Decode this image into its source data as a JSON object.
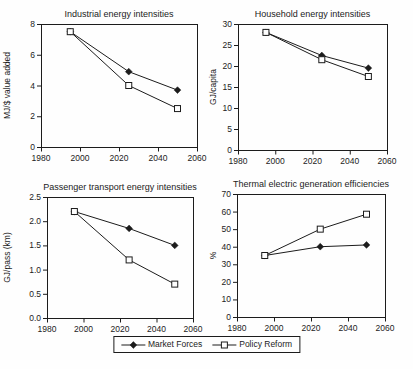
{
  "figure": {
    "name": "Energy intensity and efficiency scenario charts",
    "background": "#fefefe",
    "ink_color": "#1c1c1c"
  },
  "legend": {
    "position": "bottom-center",
    "entries": [
      {
        "label": "Market Forces",
        "marker": "filled-diamond"
      },
      {
        "label": "Policy Reform",
        "marker": "open-square"
      }
    ]
  },
  "chart_data": [
    {
      "type": "line",
      "title": "Industrial energy intensities",
      "xlabel": "",
      "ylabel": "MJ/$ value added",
      "x": [
        1995,
        2025,
        2050
      ],
      "series": [
        {
          "name": "Market Forces",
          "marker": "filled-diamond",
          "values": [
            7.5,
            4.9,
            3.7
          ]
        },
        {
          "name": "Policy Reform",
          "marker": "open-square",
          "values": [
            7.5,
            4.0,
            2.5
          ]
        }
      ],
      "xlim": [
        1980,
        2060
      ],
      "ylim": [
        0,
        8
      ],
      "xticks": [
        "1980",
        "2000",
        "2020",
        "2040",
        "2060"
      ],
      "yticks": [
        "0",
        "2",
        "4",
        "6",
        "8"
      ],
      "grid": false,
      "plot_box": true
    },
    {
      "type": "line",
      "title": "Household energy intensities",
      "xlabel": "",
      "ylabel": "GJ/capita",
      "x": [
        1995,
        2025,
        2050
      ],
      "series": [
        {
          "name": "Market Forces",
          "marker": "filled-diamond",
          "values": [
            28,
            22.5,
            19.5
          ]
        },
        {
          "name": "Policy Reform",
          "marker": "open-square",
          "values": [
            28,
            21.5,
            17.5
          ]
        }
      ],
      "xlim": [
        1980,
        2060
      ],
      "ylim": [
        0,
        30
      ],
      "xticks": [
        "1980",
        "2000",
        "2020",
        "2040",
        "2060"
      ],
      "yticks": [
        "0",
        "5",
        "10",
        "15",
        "20",
        "25",
        "30"
      ],
      "grid": false,
      "plot_box": true
    },
    {
      "type": "line",
      "title": "Passenger transport energy intensities",
      "xlabel": "",
      "ylabel": "GJ/pass (km)",
      "x": [
        1995,
        2025,
        2050
      ],
      "series": [
        {
          "name": "Market Forces",
          "marker": "filled-diamond",
          "values": [
            2.2,
            1.85,
            1.5
          ]
        },
        {
          "name": "Policy Reform",
          "marker": "open-square",
          "values": [
            2.2,
            1.2,
            0.7
          ]
        }
      ],
      "xlim": [
        1980,
        2060
      ],
      "ylim": [
        0,
        2.5
      ],
      "xticks": [
        "1980",
        "2000",
        "2020",
        "2040",
        "2060"
      ],
      "yticks": [
        "0.0",
        "0.5",
        "1.0",
        "1.5",
        "2.0",
        "2.5"
      ],
      "grid": false,
      "plot_box": true
    },
    {
      "type": "line",
      "title": "Thermal electric generation efficiencies",
      "xlabel": "",
      "ylabel": "%",
      "x": [
        1995,
        2025,
        2050
      ],
      "series": [
        {
          "name": "Market Forces",
          "marker": "filled-diamond",
          "values": [
            35,
            40,
            41
          ]
        },
        {
          "name": "Policy Reform",
          "marker": "open-square",
          "values": [
            35,
            50,
            58.5
          ]
        }
      ],
      "xlim": [
        1980,
        2060
      ],
      "ylim": [
        0,
        70
      ],
      "xticks": [
        "1980",
        "2000",
        "2020",
        "2040",
        "2060"
      ],
      "yticks": [
        "0",
        "10",
        "20",
        "30",
        "40",
        "50",
        "60",
        "70"
      ],
      "grid": false,
      "plot_box": true
    }
  ]
}
